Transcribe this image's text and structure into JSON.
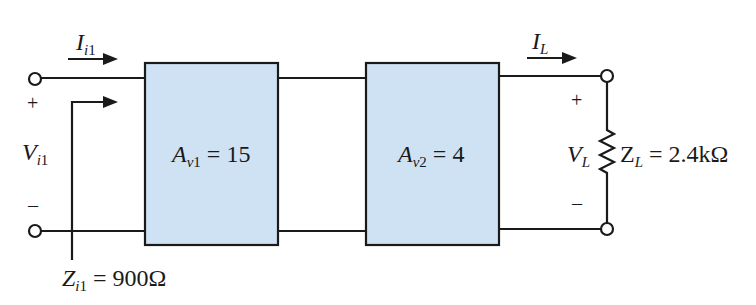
{
  "diagram": {
    "colors": {
      "wire": "#1a1a1a",
      "block_fill": "#cfe2f3",
      "block_stroke": "#1a1a1a",
      "background": "#ffffff"
    },
    "input": {
      "current_label": {
        "symbol": "I",
        "subscript_italic": "i",
        "subscript": "1"
      },
      "voltage_label": {
        "symbol": "V",
        "subscript_italic": "i",
        "subscript": "1"
      },
      "plus_sign": "+",
      "minus_sign": "–",
      "impedance_label": {
        "symbol": "Z",
        "subscript_italic": "i",
        "subscript": "1",
        "value": " = 900Ω"
      }
    },
    "stages": [
      {
        "gain_symbol": "A",
        "subscript_italic": "v",
        "subscript": "1",
        "value": " = 15"
      },
      {
        "gain_symbol": "A",
        "subscript_italic": "v",
        "subscript": "2",
        "value": " = 4"
      }
    ],
    "output": {
      "current_label": {
        "symbol": "I",
        "subscript_italic": "L"
      },
      "voltage_label": {
        "symbol": "V",
        "subscript_italic": "L"
      },
      "plus_sign": "+",
      "minus_sign": "–",
      "load_label": {
        "symbol": "Z",
        "subscript_italic": "L",
        "value": " = 2.4kΩ"
      }
    }
  }
}
